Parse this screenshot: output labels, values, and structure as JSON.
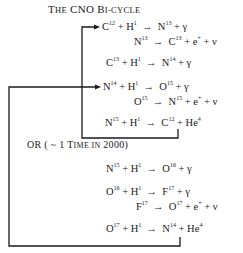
{
  "title": {
    "lead": "T",
    "lead_rest": "HE",
    "mid": " CNO ",
    "bi": "B",
    "bi_rest": "I-CYCLE"
  },
  "main_cycle": [
    {
      "lhs": [
        "C",
        "12",
        " + H",
        "1"
      ],
      "rhs": [
        "N",
        "13",
        " + γ"
      ]
    },
    {
      "lhs": [
        "N",
        "13"
      ],
      "rhs": [
        "C",
        "13",
        " + e",
        "+",
        " + ν"
      ]
    },
    {
      "lhs": [
        "C",
        "13",
        " + H",
        "1"
      ],
      "rhs": [
        "N",
        "14",
        " + γ"
      ]
    },
    {
      "lhs": [
        "N",
        "14",
        " + H",
        "1"
      ],
      "rhs": [
        "O",
        "15",
        " + γ"
      ]
    },
    {
      "lhs": [
        "O",
        "15"
      ],
      "rhs": [
        "N",
        "15",
        " + e",
        "+",
        " + ν"
      ]
    },
    {
      "lhs": [
        "N",
        "15",
        " + H",
        "1"
      ],
      "rhs": [
        "C",
        "12",
        " + He",
        "4"
      ]
    }
  ],
  "branch_label": {
    "prefix": "OR  ( ~ 1 ",
    "t": "T",
    "t_rest": "IME ",
    "in": "IN",
    "suffix": " 2000)"
  },
  "side_cycle": [
    {
      "lhs": [
        "N",
        "15",
        " + H",
        "1"
      ],
      "rhs": [
        "O",
        "16",
        " + γ"
      ]
    },
    {
      "lhs": [
        "O",
        "16",
        " + H",
        "1"
      ],
      "rhs": [
        "F",
        "17",
        " + γ"
      ]
    },
    {
      "lhs": [
        "F",
        "17"
      ],
      "rhs": [
        "O",
        "17",
        " + e",
        "+",
        " + ν"
      ]
    },
    {
      "lhs": [
        "O",
        "17",
        " + H",
        "1"
      ],
      "rhs": [
        "N",
        "14",
        " + He",
        "4"
      ]
    }
  ],
  "arrow": "→"
}
